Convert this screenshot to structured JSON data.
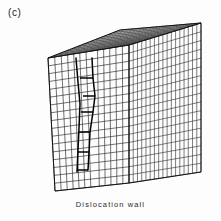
{
  "figure": {
    "panel_label": "(c)",
    "caption": "Dislocation  wall",
    "background_color": "#fdfdfd",
    "line_color": "#141414",
    "wall_color": "#000000"
  },
  "geometry": {
    "description": "three-dimensional finite-element mesh of a rectangular block drawn in oblique projection, showing a dislocation wall on the front face",
    "front_face": {
      "top_left": [
        48,
        58
      ],
      "top_right": [
        129,
        45
      ],
      "bottom_right": [
        129,
        183
      ],
      "bottom_left": [
        55,
        191
      ],
      "columns": 12,
      "rows": 17
    },
    "right_face": {
      "near_top": [
        129,
        45
      ],
      "far_top": [
        201,
        23
      ],
      "far_bottom": [
        201,
        172
      ],
      "near_bottom": [
        129,
        183
      ],
      "columns": 17,
      "rows": 17
    },
    "top_face": {
      "front_left": [
        48,
        58
      ],
      "front_right": [
        129,
        45
      ],
      "back_right": [
        201,
        23
      ],
      "back_left": [
        120,
        30
      ],
      "columns": 12,
      "rows": 17
    },
    "dislocation_wall": {
      "label": "Dislocation  wall",
      "path": [
        [
          92,
          58
        ],
        [
          93,
          78
        ],
        [
          95,
          96
        ],
        [
          93,
          112
        ],
        [
          90,
          132
        ],
        [
          89,
          152
        ],
        [
          88,
          170
        ]
      ],
      "step_segments": [
        {
          "y": 78,
          "x_from": 80,
          "x_to": 93
        },
        {
          "y": 96,
          "x_from": 83,
          "x_to": 95
        },
        {
          "y": 112,
          "x_from": 81,
          "x_to": 93
        },
        {
          "y": 132,
          "x_from": 79,
          "x_to": 90
        },
        {
          "y": 152,
          "x_from": 78,
          "x_to": 89
        },
        {
          "y": 170,
          "x_from": 77,
          "x_to": 88
        }
      ],
      "secondary_path": [
        [
          76,
          58
        ],
        [
          78,
          82
        ],
        [
          80,
          104
        ],
        [
          79,
          128
        ],
        [
          78,
          150
        ],
        [
          77,
          172
        ]
      ]
    }
  }
}
